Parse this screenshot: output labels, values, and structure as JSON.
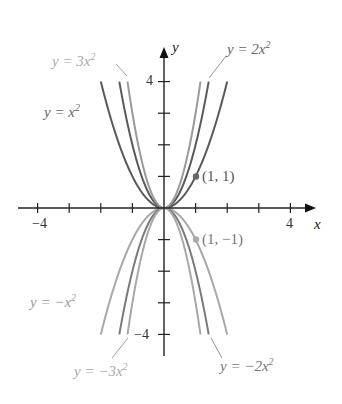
{
  "chart_data": {
    "type": "line",
    "title": "",
    "xlabel": "x",
    "ylabel": "y",
    "xlim": [
      -4.5,
      4.5
    ],
    "ylim": [
      -4.3,
      4.6
    ],
    "grid": false,
    "x_ticks": [
      -4,
      -3,
      -2,
      -1,
      1,
      2,
      3,
      4
    ],
    "y_ticks": [
      -4,
      -3,
      -2,
      -1,
      1,
      2,
      3,
      4
    ],
    "x_tick_labels": {
      "-4": "−4",
      "4": "4"
    },
    "y_tick_labels": {
      "4": "4",
      "-4": "−4"
    },
    "series": [
      {
        "name": "y = x²",
        "a": 1,
        "color": "#5a5a5a"
      },
      {
        "name": "y = 2x²",
        "a": 2,
        "color": "#5a5a5a"
      },
      {
        "name": "y = 3x²",
        "a": 3,
        "color": "#9a9a9a"
      },
      {
        "name": "y = −x²",
        "a": -1,
        "color": "#a8a8a8"
      },
      {
        "name": "y = −2x²",
        "a": -2,
        "color": "#7a7a7a"
      },
      {
        "name": "y = −3x²",
        "a": -3,
        "color": "#a8a8a8"
      }
    ],
    "points": [
      {
        "x": 1,
        "y": 1,
        "label": "(1, 1)"
      },
      {
        "x": 1,
        "y": -1,
        "label": "(1, −1)"
      }
    ]
  },
  "labels": {
    "x_axis": "x",
    "y_axis": "y",
    "tick_neg4_x": "−4",
    "tick_pos4_x": "4",
    "tick_pos4_y": "4",
    "tick_neg4_y": "−4",
    "point_pos": "(1, 1)",
    "point_neg": "(1, −1)",
    "curve_3x2": "y = 3x",
    "curve_x2": "y = x",
    "curve_2x2": "y = 2x",
    "curve_negx2": "y = −x",
    "curve_neg3x2": "y = −3x",
    "curve_neg2x2": "y = −2x",
    "sup": "2"
  }
}
